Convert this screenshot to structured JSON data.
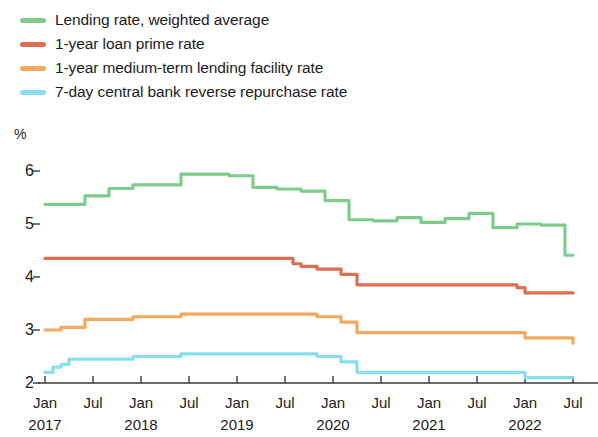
{
  "chart_data": {
    "type": "line",
    "title": "",
    "subtitle": "",
    "xlabel": "",
    "ylabel": "%",
    "unit": "%",
    "grid": false,
    "legend_position": "top-left",
    "ylim": [
      2,
      6
    ],
    "yticks": [
      2,
      3,
      4,
      5,
      6
    ],
    "ytick_labels": [
      "2",
      "3",
      "4",
      "5",
      "6"
    ],
    "xlim": [
      "2017-01",
      "2022-07"
    ],
    "xtick_labels": [
      "Jan",
      "Jul",
      "Jan",
      "Jul",
      "Jan",
      "Jul",
      "Jan",
      "Jul",
      "Jan",
      "Jul",
      "Jan",
      "Jul"
    ],
    "xtick_years": [
      "2017",
      "2018",
      "2019",
      "2020",
      "2021",
      "2022"
    ],
    "x": [
      "2017-01",
      "2017-02",
      "2017-03",
      "2017-04",
      "2017-05",
      "2017-06",
      "2017-07",
      "2017-08",
      "2017-09",
      "2017-10",
      "2017-11",
      "2017-12",
      "2018-01",
      "2018-02",
      "2018-03",
      "2018-04",
      "2018-05",
      "2018-06",
      "2018-07",
      "2018-08",
      "2018-09",
      "2018-10",
      "2018-11",
      "2018-12",
      "2019-01",
      "2019-02",
      "2019-03",
      "2019-04",
      "2019-05",
      "2019-06",
      "2019-07",
      "2019-08",
      "2019-09",
      "2019-10",
      "2019-11",
      "2019-12",
      "2020-01",
      "2020-02",
      "2020-03",
      "2020-04",
      "2020-05",
      "2020-06",
      "2020-07",
      "2020-08",
      "2020-09",
      "2020-10",
      "2020-11",
      "2020-12",
      "2021-01",
      "2021-02",
      "2021-03",
      "2021-04",
      "2021-05",
      "2021-06",
      "2021-07",
      "2021-08",
      "2021-09",
      "2021-10",
      "2021-11",
      "2021-12",
      "2022-01",
      "2022-02",
      "2022-03",
      "2022-04",
      "2022-05",
      "2022-06",
      "2022-07"
    ],
    "series": [
      {
        "name": "Lending rate, weighted average",
        "color": "#7ECB8C",
        "values": [
          5.37,
          5.37,
          5.37,
          5.37,
          5.37,
          5.53,
          5.53,
          5.53,
          5.67,
          5.67,
          5.67,
          5.74,
          5.74,
          5.74,
          5.74,
          5.74,
          5.74,
          5.94,
          5.94,
          5.94,
          5.94,
          5.94,
          5.94,
          5.91,
          5.91,
          5.91,
          5.69,
          5.69,
          5.69,
          5.66,
          5.66,
          5.66,
          5.62,
          5.62,
          5.62,
          5.44,
          5.44,
          5.44,
          5.08,
          5.08,
          5.08,
          5.06,
          5.06,
          5.06,
          5.12,
          5.12,
          5.12,
          5.03,
          5.03,
          5.03,
          5.1,
          5.1,
          5.1,
          5.2,
          5.2,
          5.2,
          4.93,
          4.93,
          4.93,
          5.0,
          5.0,
          5.0,
          4.98,
          4.98,
          4.98,
          4.41,
          4.41
        ]
      },
      {
        "name": "1-year loan prime rate",
        "color": "#DD6E52",
        "values": [
          4.35,
          4.35,
          4.35,
          4.35,
          4.35,
          4.35,
          4.35,
          4.35,
          4.35,
          4.35,
          4.35,
          4.35,
          4.35,
          4.35,
          4.35,
          4.35,
          4.35,
          4.35,
          4.35,
          4.35,
          4.35,
          4.35,
          4.35,
          4.35,
          4.35,
          4.35,
          4.35,
          4.35,
          4.35,
          4.35,
          4.35,
          4.25,
          4.2,
          4.2,
          4.15,
          4.15,
          4.15,
          4.05,
          4.05,
          3.85,
          3.85,
          3.85,
          3.85,
          3.85,
          3.85,
          3.85,
          3.85,
          3.85,
          3.85,
          3.85,
          3.85,
          3.85,
          3.85,
          3.85,
          3.85,
          3.85,
          3.85,
          3.85,
          3.85,
          3.8,
          3.7,
          3.7,
          3.7,
          3.7,
          3.7,
          3.7,
          3.7
        ]
      },
      {
        "name": "1-year medium-term lending facility rate",
        "color": "#F5A85C",
        "values": [
          3.0,
          3.0,
          3.05,
          3.05,
          3.05,
          3.2,
          3.2,
          3.2,
          3.2,
          3.2,
          3.2,
          3.25,
          3.25,
          3.25,
          3.25,
          3.25,
          3.25,
          3.3,
          3.3,
          3.3,
          3.3,
          3.3,
          3.3,
          3.3,
          3.3,
          3.3,
          3.3,
          3.3,
          3.3,
          3.3,
          3.3,
          3.3,
          3.3,
          3.3,
          3.25,
          3.25,
          3.25,
          3.15,
          3.15,
          2.95,
          2.95,
          2.95,
          2.95,
          2.95,
          2.95,
          2.95,
          2.95,
          2.95,
          2.95,
          2.95,
          2.95,
          2.95,
          2.95,
          2.95,
          2.95,
          2.95,
          2.95,
          2.95,
          2.95,
          2.95,
          2.85,
          2.85,
          2.85,
          2.85,
          2.85,
          2.85,
          2.75
        ]
      },
      {
        "name": "7-day central bank reverse repurchase rate",
        "color": "#87DEEE",
        "values": [
          2.2,
          2.3,
          2.35,
          2.45,
          2.45,
          2.45,
          2.45,
          2.45,
          2.45,
          2.45,
          2.45,
          2.5,
          2.5,
          2.5,
          2.5,
          2.5,
          2.5,
          2.55,
          2.55,
          2.55,
          2.55,
          2.55,
          2.55,
          2.55,
          2.55,
          2.55,
          2.55,
          2.55,
          2.55,
          2.55,
          2.55,
          2.55,
          2.55,
          2.55,
          2.5,
          2.5,
          2.5,
          2.4,
          2.4,
          2.2,
          2.2,
          2.2,
          2.2,
          2.2,
          2.2,
          2.2,
          2.2,
          2.2,
          2.2,
          2.2,
          2.2,
          2.2,
          2.2,
          2.2,
          2.2,
          2.2,
          2.2,
          2.2,
          2.2,
          2.2,
          2.1,
          2.1,
          2.1,
          2.1,
          2.1,
          2.1,
          2.1
        ]
      }
    ]
  },
  "legend": {
    "items": [
      {
        "label": "Lending rate, weighted average",
        "color": "#7ECB8C"
      },
      {
        "label": "1-year loan prime rate",
        "color": "#DD6E52"
      },
      {
        "label": "1-year medium-term lending facility rate",
        "color": "#F5A85C"
      },
      {
        "label": "7-day central bank reverse repurchase rate",
        "color": "#87DEEE"
      }
    ]
  },
  "axis": {
    "unit": "%",
    "y_labels": [
      "6",
      "5",
      "4",
      "3",
      "2"
    ],
    "x_month_labels": [
      "Jan",
      "Jul",
      "Jan",
      "Jul",
      "Jan",
      "Jul",
      "Jan",
      "Jul",
      "Jan",
      "Jul",
      "Jan",
      "Jul"
    ],
    "x_year_labels": [
      "2017",
      "2018",
      "2019",
      "2020",
      "2021",
      "2022"
    ]
  }
}
